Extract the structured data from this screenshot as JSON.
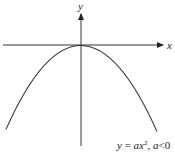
{
  "diagram": {
    "title": "",
    "x_axis_label": "x",
    "y_axis_label": "y",
    "equation": {
      "lhs": "y",
      "eq": " = ",
      "coef": "a",
      "var": "x",
      "exp": "2",
      "sep": ", ",
      "cond_var": "a",
      "cond_rest": "<0"
    },
    "curve": "downward-opening parabola with vertex at origin",
    "colors": {
      "axis": "#333333",
      "curve": "#333333",
      "background": "#ffffff"
    }
  }
}
